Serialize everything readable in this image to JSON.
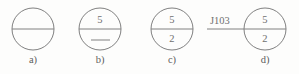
{
  "figure": {
    "width": 299,
    "height": 74,
    "background_color": "#fdfdfc",
    "stroke_color": "#808080",
    "text_color": "#6f6f6f",
    "items": [
      {
        "id": "a",
        "caption": "a)",
        "circle": {
          "cx": 33,
          "cy": 29,
          "r": 21
        },
        "diameter_line": true,
        "top_text": "",
        "bottom_text": "",
        "bottom_dash": false,
        "lead_line": false,
        "lead_label": ""
      },
      {
        "id": "b",
        "caption": "b)",
        "circle": {
          "cx": 100,
          "cy": 29,
          "r": 21
        },
        "diameter_line": true,
        "top_text": "5",
        "bottom_text": "",
        "bottom_dash": true,
        "lead_line": false,
        "lead_label": ""
      },
      {
        "id": "c",
        "caption": "c)",
        "circle": {
          "cx": 172,
          "cy": 29,
          "r": 21
        },
        "diameter_line": true,
        "top_text": "5",
        "bottom_text": "2",
        "bottom_dash": false,
        "lead_line": false,
        "lead_label": ""
      },
      {
        "id": "d",
        "caption": "d)",
        "circle": {
          "cx": 265,
          "cy": 29,
          "r": 21
        },
        "diameter_line": true,
        "top_text": "5",
        "bottom_text": "2",
        "bottom_dash": false,
        "lead_line": true,
        "lead_label": "J103"
      }
    ]
  }
}
